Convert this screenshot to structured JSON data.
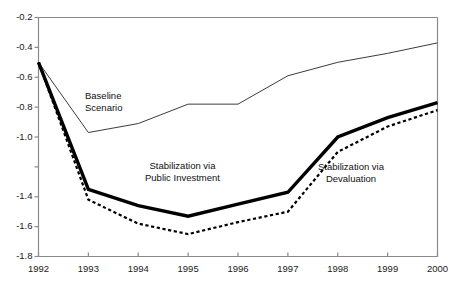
{
  "chart_data": {
    "type": "line",
    "title": "",
    "xlabel": "",
    "ylabel": "",
    "xlim": [
      1992,
      2000
    ],
    "ylim": [
      -1.8,
      -0.2
    ],
    "grid": false,
    "legend_position": "inline-annotations",
    "x": [
      1992,
      1993,
      1994,
      1995,
      1996,
      1997,
      1998,
      1999,
      2000
    ],
    "x_tick_labels": [
      "1992",
      "1993",
      "1994",
      "1995",
      "1996",
      "1997",
      "1998",
      "1999",
      "2000"
    ],
    "y_tick_values": [
      -0.2,
      -0.4,
      -0.6,
      -0.8,
      -1.0,
      -1.4,
      -1.6,
      -1.8
    ],
    "y_tick_labels": [
      "-0.2",
      "-0.4",
      "-0.6",
      "-0.8",
      "-1.0",
      "-1.4",
      "-1.6",
      "-1.8"
    ],
    "series": [
      {
        "name": "Baseline Scenario",
        "style": "thin-solid",
        "color": "#3c3c3c",
        "width": 1,
        "values": [
          -0.5,
          -0.97,
          -0.91,
          -0.78,
          -0.78,
          -0.59,
          -0.5,
          -0.44,
          -0.37
        ]
      },
      {
        "name": "Stabilization via Public Investment",
        "style": "thick-solid",
        "color": "#000000",
        "width": 3.4,
        "values": [
          -0.5,
          -1.35,
          -1.46,
          -1.53,
          -1.45,
          -1.37,
          -1.0,
          -0.87,
          -0.77
        ]
      },
      {
        "name": "Stabilization via Devaluation",
        "style": "dotted",
        "color": "#000000",
        "width": 2.2,
        "values": [
          -0.5,
          -1.42,
          -1.58,
          -1.65,
          -1.57,
          -1.5,
          -1.1,
          -0.93,
          -0.82
        ]
      }
    ],
    "annotations": [
      {
        "text_line1": "Baseline",
        "text_line2": "Scenario",
        "x_px": 85,
        "y_px": 90
      },
      {
        "text_line1": "Stabilization via",
        "text_line2": "Public Investment",
        "x_px": 145,
        "y_px": 160
      },
      {
        "text_line1": "Stabilization via",
        "text_line2": "Devaluation",
        "x_px": 318,
        "y_px": 161
      }
    ]
  },
  "axis": {
    "axis_color": "#8a8a8a",
    "tick_color": "#8a8a8a"
  },
  "clipped_header": ""
}
